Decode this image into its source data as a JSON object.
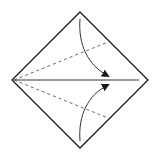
{
  "diagram": {
    "type": "origami-kite-fold",
    "background": "#ffffff",
    "stroke_color": "#1a1a1a",
    "shapes": {
      "square": {
        "points": [
          [
            80,
            12
          ],
          [
            148,
            80
          ],
          [
            80,
            148
          ],
          [
            12,
            80
          ]
        ]
      },
      "center_line": {
        "x1": 14,
        "y1": 80,
        "x2": 139,
        "y2": 80
      },
      "dashed_upper": {
        "x1": 14,
        "y1": 80,
        "x2": 108,
        "y2": 42
      },
      "dashed_lower": {
        "x1": 14,
        "y1": 80,
        "x2": 108,
        "y2": 118
      },
      "arrow_upper": {
        "path": "M80,19 C78,45 88,65 110,77"
      },
      "arrow_lower": {
        "path": "M80,141 C78,115 88,95 110,84"
      }
    },
    "labels": []
  }
}
